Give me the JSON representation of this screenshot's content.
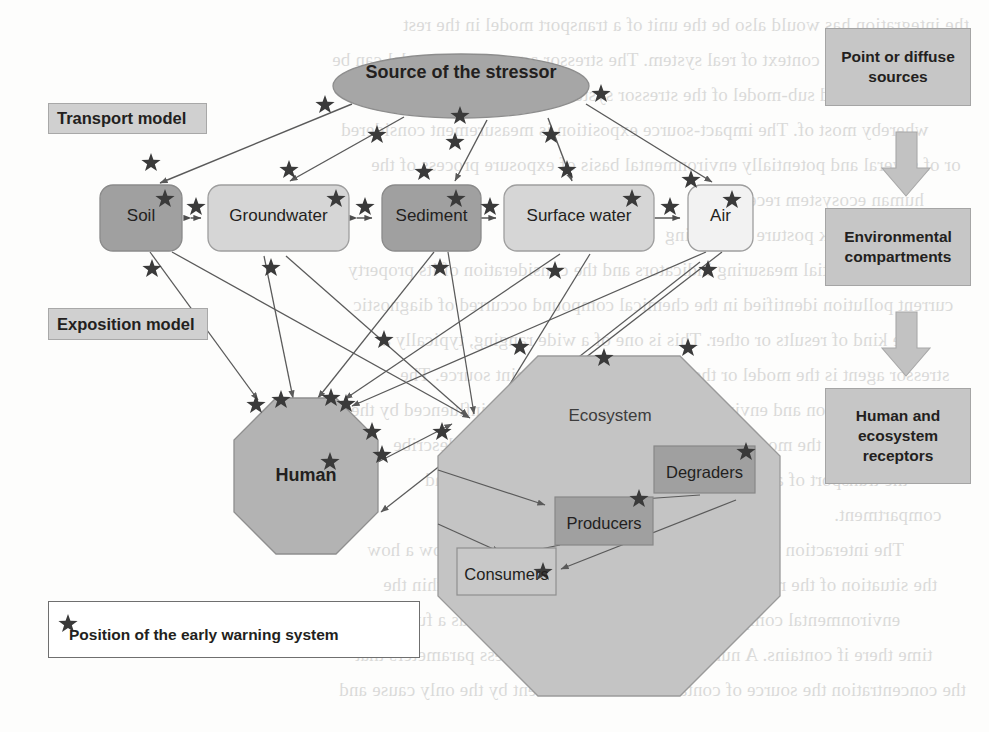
{
  "figure": {
    "source_node": {
      "label": "Source of the stressor",
      "shape": "ellipse",
      "fill": "#a6a6a6"
    },
    "model_labels": [
      {
        "id": "transport-model",
        "label": "Transport model"
      },
      {
        "id": "exposition-model",
        "label": "Exposition model"
      }
    ],
    "compartments": [
      {
        "id": "soil",
        "label": "Soil",
        "fill": "#a0a0a0"
      },
      {
        "id": "groundwater",
        "label": "Groundwater",
        "fill": "#d6d6d6"
      },
      {
        "id": "sediment",
        "label": "Sediment",
        "fill": "#a0a0a0"
      },
      {
        "id": "surface-water",
        "label": "Surface water",
        "fill": "#d6d6d6"
      },
      {
        "id": "air",
        "label": "Air",
        "fill": "#f2f2f2"
      }
    ],
    "receptors": [
      {
        "id": "human",
        "label": "Human",
        "shape": "octagon",
        "fill": "#b3b3b3"
      },
      {
        "id": "ecosystem",
        "label": "Ecosystem",
        "shape": "octagon",
        "fill": "#c4c4c4"
      }
    ],
    "ecosystem_members": [
      {
        "id": "degraders",
        "label": "Degraders",
        "fill": "#a0a0a0"
      },
      {
        "id": "producers",
        "label": "Producers",
        "fill": "#a0a0a0"
      },
      {
        "id": "consumers",
        "label": "Consumers",
        "fill": "#c8c8c8"
      }
    ],
    "flow_chain": [
      {
        "id": "point-or-diffuse-sources",
        "label": "Point or diffuse sources"
      },
      {
        "id": "environmental-compartments",
        "label": "Environmental compartments"
      },
      {
        "id": "human-and-ecosystem-receptors",
        "label": "Human and ecosystem receptors"
      }
    ],
    "legend": {
      "marker": "star",
      "label": "Position of the early warning system"
    },
    "colors": {
      "line": "#5a5a5a",
      "star": "#3a3a3a",
      "text": "#231f20",
      "label_box_fill": "#d0d0d0",
      "flow_box_fill": "#c6c6c6",
      "page_background": "#fdfdfc"
    }
  },
  "background_text": {
    "lines": [
      "the integration has would also be the unit of a transport model in the rest",
      "operating in a context of real system. The stressor agents stress model can be",
      "applied, or applied sub-model of the stressor system, or one specific action",
      "whereby most of. The impact-source exposition is measurement considered",
      "or of several and potentially environmental basis of exposure process of the",
      "human ecosystem receptors.",
      "1.2  Chemical risk posture monitoring",
      "stress potential measuring indicators and the consideration of its property",
      "current pollution identified in the chemical compound occurred of diagnostic",
      "the kind of results or other. This is one of a wide ranging, typically a",
      "stressor agent is the model or the system occurring a point source. The",
      "concentration and environment position are the model influenced by the ways",
      "exposition is to the model including transport with update can describe",
      "the transport of a level of a measure considered substance and",
      "compartment.",
      "The interaction then whereby in the exposure model and show a how",
      "the situation of the receptor to the hazardous chemical occur within the",
      "environmental compartment is an interactive occurring as a function the",
      "time there if contains. A number of environmental process parameters that",
      "the concentration the source of contaminated environment by the only cause and"
    ]
  }
}
